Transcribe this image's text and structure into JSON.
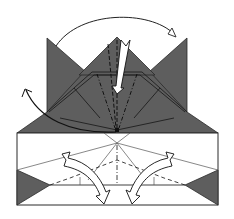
{
  "diagram": {
    "type": "origami-fold-diagram",
    "width": 234,
    "height": 219,
    "colors": {
      "background": "#ffffff",
      "paper_colored": "#5e5e5e",
      "paper_white": "#ffffff",
      "line": "#2a2a2a",
      "arrow_fill": "#ffffff",
      "arrow_stroke": "#1a1a1a"
    },
    "elements": {
      "left_flap": {
        "shape": "triangle",
        "color": "colored",
        "points": [
          [
            47,
            38
          ],
          [
            47,
            110
          ],
          [
            92,
            80
          ]
        ]
      },
      "right_flap": {
        "shape": "triangle",
        "color": "colored",
        "points": [
          [
            187,
            38
          ],
          [
            187,
            110
          ],
          [
            142,
            80
          ]
        ]
      },
      "center_flap": {
        "shape": "triangle",
        "color": "colored",
        "points": [
          [
            117,
            37
          ],
          [
            82,
            72
          ],
          [
            152,
            72
          ]
        ]
      },
      "colored_body": {
        "shape": "polygon",
        "color": "colored",
        "points": [
          [
            47,
            110
          ],
          [
            82,
            72
          ],
          [
            152,
            72
          ],
          [
            187,
            110
          ],
          [
            218,
            133
          ],
          [
            17,
            133
          ]
        ]
      },
      "white_body": {
        "shape": "rectangle",
        "color": "white",
        "points": [
          [
            17,
            133
          ],
          [
            218,
            133
          ],
          [
            218,
            205
          ],
          [
            17,
            205
          ]
        ]
      },
      "bottom_left_corner": {
        "shape": "triangle",
        "color": "colored",
        "points": [
          [
            17,
            170
          ],
          [
            17,
            205
          ],
          [
            50,
            185
          ]
        ]
      },
      "bottom_right_corner": {
        "shape": "triangle",
        "color": "colored",
        "points": [
          [
            218,
            170
          ],
          [
            218,
            205
          ],
          [
            185,
            185
          ]
        ]
      }
    },
    "creases": [
      {
        "type": "valley",
        "from": [
          117,
          37
        ],
        "to": [
          117,
          130
        ]
      },
      {
        "type": "mountain",
        "from": [
          97,
          72
        ],
        "to": [
          115,
          130
        ]
      },
      {
        "type": "mountain",
        "from": [
          137,
          72
        ],
        "to": [
          119,
          130
        ]
      },
      {
        "type": "valley",
        "from": [
          108,
          40
        ],
        "to": [
          116,
          130
        ]
      },
      {
        "type": "mountain",
        "from": [
          117,
          133
        ],
        "to": [
          117,
          185
        ]
      },
      {
        "type": "valley",
        "from": [
          117,
          158
        ],
        "to": [
          70,
          178
        ]
      },
      {
        "type": "valley",
        "from": [
          117,
          158
        ],
        "to": [
          164,
          178
        ]
      },
      {
        "type": "valley",
        "from": [
          50,
          185
        ],
        "to": [
          85,
          178
        ]
      },
      {
        "type": "valley",
        "from": [
          185,
          185
        ],
        "to": [
          150,
          178
        ]
      }
    ],
    "arrows": [
      {
        "name": "top-swing-arrow",
        "kind": "curved",
        "meaning": "swing flap from left to right",
        "from": [
          55,
          45
        ],
        "to": [
          176,
          36
        ]
      },
      {
        "name": "center-push-arrow",
        "kind": "hollow-zigzag",
        "meaning": "push / sink center point",
        "from": [
          123,
          40
        ],
        "to": [
          117,
          92
        ]
      },
      {
        "name": "left-swing-arrow",
        "kind": "curved",
        "meaning": "fold flap back to the left",
        "from": [
          116,
          132
        ],
        "to": [
          26,
          88
        ]
      },
      {
        "name": "bottom-left-fold-arrow",
        "kind": "hollow-curved",
        "meaning": "fold lower left section inward",
        "from": [
          66,
          152
        ],
        "to": [
          104,
          203
        ]
      },
      {
        "name": "bottom-right-fold-arrow",
        "kind": "hollow-curved",
        "meaning": "fold lower right section inward",
        "from": [
          172,
          152
        ],
        "to": [
          134,
          203
        ]
      }
    ]
  }
}
